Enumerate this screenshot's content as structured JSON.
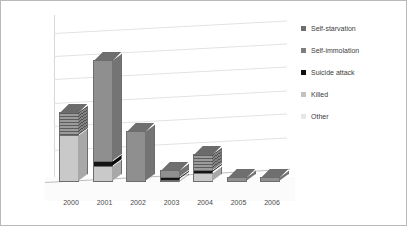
{
  "chart_data": {
    "type": "bar",
    "subtype": "stacked-column-3d",
    "title": "",
    "xlabel": "",
    "ylabel": "",
    "categories": [
      "2000",
      "2001",
      "2002",
      "2003",
      "2004",
      "2005",
      "2006"
    ],
    "ylim": [
      0,
      65
    ],
    "yticks": [
      0,
      10,
      20,
      30,
      40,
      50,
      60
    ],
    "ytick_labels": [
      "0",
      "10",
      "20",
      "30",
      "40",
      "50",
      "60"
    ],
    "grid": true,
    "legend_position": "right",
    "series": [
      {
        "name": "Self-starvation",
        "color": "#6e6e6e",
        "values": [
          10,
          0,
          0,
          0,
          7,
          0,
          0
        ]
      },
      {
        "name": "Self-immolation",
        "color": "#7d7d7d",
        "values": [
          0,
          43,
          22,
          3,
          0,
          2,
          2
        ]
      },
      {
        "name": "Suicide attack",
        "color": "#101010",
        "values": [
          0,
          2,
          0,
          1,
          1,
          0,
          0
        ]
      },
      {
        "name": "Killed",
        "color": "#c2c2c2",
        "values": [
          20,
          7,
          0,
          1,
          4,
          0,
          0
        ]
      },
      {
        "name": "Other",
        "color": "#e6e6e6",
        "values": [
          0,
          0,
          0,
          0,
          0,
          0,
          0
        ]
      }
    ],
    "totals": [
      30,
      52,
      22,
      5,
      12,
      2,
      2
    ]
  },
  "legend": {
    "items": [
      {
        "label": "Self-starvation",
        "swatch": "legend-swatch-self-starvation"
      },
      {
        "label": "Self-immolation",
        "swatch": "legend-swatch-self-immolation"
      },
      {
        "label": "Suicide attack",
        "swatch": "legend-swatch-suicide-attack"
      },
      {
        "label": "Killed",
        "swatch": "legend-swatch-killed"
      },
      {
        "label": "Other",
        "swatch": "legend-swatch-other"
      }
    ]
  }
}
